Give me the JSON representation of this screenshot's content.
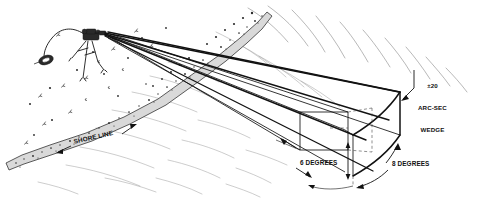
{
  "figure": {
    "background_color": "#ffffff",
    "line_color": "#121212",
    "water_line_color": "#7d7d7d",
    "shore_fill_color": "#d9d9d9"
  },
  "labels": {
    "wedge": {
      "line1": "±20",
      "line2": "ARC-SEC",
      "line3": "WEDGE"
    },
    "six_degrees": "6 DEGREES",
    "eight_degrees": "8 DEGREES",
    "shore_line": "SHORE LINE"
  },
  "annotations": {
    "vertical_angle_value": "6",
    "vertical_angle_unit": "DEGREES",
    "horizontal_angle_value": "8",
    "horizontal_angle_unit": "DEGREES",
    "wedge_tolerance": "±20",
    "wedge_tolerance_unit": "ARC-SEC"
  },
  "elements": {
    "instrument": "theodolite-on-tripod",
    "power_box": "battery-box",
    "cable": "instrument-cable",
    "beam_count": 4,
    "terrain": "shore-line-band",
    "water": "water-surface-ripples",
    "volume": "arc-second-wedge"
  }
}
